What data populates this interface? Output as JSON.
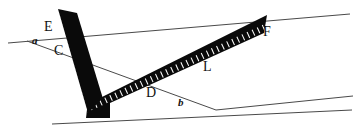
{
  "figure": {
    "background_color": "#ffffff",
    "line_color": "#4a4a4a",
    "ruler_color": "#0a0a0a",
    "label_color": "#111111",
    "width": 357,
    "height": 126
  },
  "labels": {
    "point_e": "E",
    "point_c": "C",
    "point_d": "D",
    "point_f": "F",
    "point_l": "L",
    "angle_a": "a",
    "angle_b": "b"
  },
  "geometry": {
    "upper_line": {
      "x1": 8,
      "y1": 43,
      "x2": 350,
      "y2": 14
    },
    "lower_line": {
      "x1": 52,
      "y1": 124,
      "x2": 352,
      "y2": 110
    },
    "transversal": {
      "x1": 27,
      "y1": 41,
      "x2": 216,
      "y2": 110
    },
    "ray_b_upper": {
      "x1": 216,
      "y1": 110,
      "x2": 353,
      "y2": 96
    },
    "ruler": {
      "type": "carpenters-square",
      "vertical_arm": {
        "top_x": 60,
        "top_y": 10,
        "bottom_x": 103,
        "bottom_y": 112
      },
      "diagonal_arm": {
        "start_x": 103,
        "start_y": 112,
        "end_x": 264,
        "end_y": 22
      },
      "arm_width": 17,
      "tick_count_vertical": 26,
      "tick_count_diagonal": 34
    }
  },
  "label_positions": {
    "point_e": {
      "x": 44,
      "y": 22
    },
    "point_c": {
      "x": 54,
      "y": 44
    },
    "point_d": {
      "x": 145,
      "y": 86
    },
    "point_f": {
      "x": 263,
      "y": 26
    },
    "point_l": {
      "x": 202,
      "y": 60
    },
    "angle_a": {
      "x": 32,
      "y": 36
    },
    "angle_b": {
      "x": 178,
      "y": 96
    }
  }
}
